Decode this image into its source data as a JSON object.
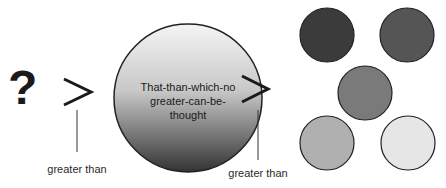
{
  "diagram": {
    "unknown_symbol": "?",
    "comparators": [
      {
        "symbol": ">",
        "label": "greater than"
      },
      {
        "symbol": ">",
        "label": "greater than"
      }
    ],
    "central_concept": {
      "lines": [
        "That-than-which-no",
        "greater-can-be-",
        "thought"
      ],
      "gradient": {
        "top": "#f2f2f2",
        "bottom": "#3a3a3a"
      }
    },
    "small_circles": [
      {
        "fill": "#3b3b3b"
      },
      {
        "fill": "#555555"
      },
      {
        "fill": "#7a7a7a"
      },
      {
        "fill": "#b0b0b0"
      },
      {
        "fill": "#e6e6e6"
      }
    ]
  }
}
